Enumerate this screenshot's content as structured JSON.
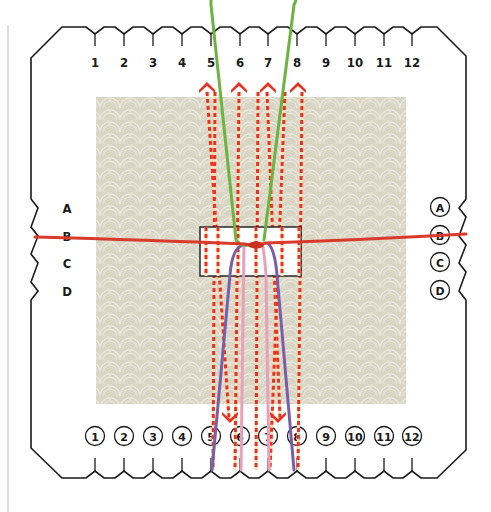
{
  "diagram": {
    "top_slot_labels": [
      "1",
      "2",
      "3",
      "4",
      "5",
      "6",
      "7",
      "8",
      "9",
      "10",
      "11",
      "12"
    ],
    "bottom_slot_labels": [
      "1",
      "2",
      "3",
      "4",
      "5",
      "6",
      "7",
      "8",
      "9",
      "10",
      "11",
      "12"
    ],
    "left_slot_labels": [
      "A",
      "B",
      "C",
      "D"
    ],
    "right_slot_labels": [
      "A",
      "B",
      "C",
      "D"
    ],
    "threads": [
      {
        "name": "green",
        "color": "#6db33f",
        "from": "top 5",
        "to": "center"
      },
      {
        "name": "green",
        "color": "#6db33f",
        "from": "top 8",
        "to": "center"
      },
      {
        "name": "purple",
        "color": "#7b5ea7",
        "from": "center",
        "to": "bottom 5"
      },
      {
        "name": "pink",
        "color": "#e9a0b8",
        "from": "center",
        "to": "bottom 6"
      },
      {
        "name": "pink",
        "color": "#e9a0b8",
        "from": "center",
        "to": "bottom 7"
      },
      {
        "name": "purple",
        "color": "#7b5ea7",
        "from": "center",
        "to": "bottom 8"
      },
      {
        "name": "red-weft",
        "color": "#d93a2b",
        "from": "left B",
        "to": "right B"
      }
    ],
    "move_arrows": {
      "color": "#e8321f",
      "up_at": [
        "5",
        "6",
        "7",
        "8"
      ],
      "down_at": [
        "6",
        "7"
      ]
    },
    "colors": {
      "outline": "#1a1a1a",
      "board_texture": "#dcd9cb",
      "center_box": "#ffffff"
    }
  }
}
